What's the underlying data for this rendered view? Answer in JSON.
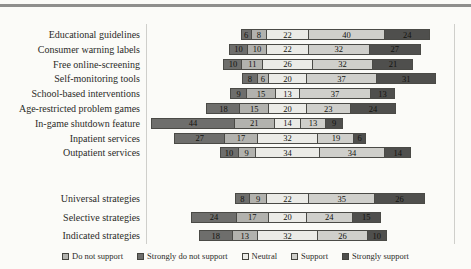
{
  "chart_data": {
    "type": "bar",
    "variant": "diverging_stacked_likert",
    "orientation": "horizontal",
    "unit": "percent",
    "title": "",
    "xlabel": "",
    "ylabel": "",
    "axes": "none",
    "value_labels": "inside",
    "legend_position": "bottom",
    "categories": [
      "Educational guidelines",
      "Consumer warning labels",
      "Free online-screening",
      "Self-monitoring tools",
      "School-based interventions",
      "Age-restricted problem games",
      "In-game shutdown feature",
      "Inpatient services",
      "Outpatient services",
      "Universal strategies",
      "Selective strategies",
      "Indicated strategies"
    ],
    "group_split_index": 9,
    "series": [
      {
        "name": "Strongly do not support",
        "color": "#6e6e6c",
        "values": [
          6,
          10,
          10,
          8,
          9,
          18,
          44,
          27,
          10,
          8,
          24,
          18
        ]
      },
      {
        "name": "Do not support",
        "color": "#b2b2ae",
        "values": [
          8,
          10,
          11,
          6,
          15,
          15,
          21,
          17,
          9,
          9,
          17,
          13
        ]
      },
      {
        "name": "Neutral",
        "color": "#ebebe7",
        "values": [
          22,
          22,
          26,
          20,
          13,
          20,
          14,
          32,
          34,
          22,
          20,
          32
        ]
      },
      {
        "name": "Support",
        "color": "#cfcfcb",
        "values": [
          40,
          32,
          32,
          37,
          37,
          23,
          13,
          19,
          34,
          35,
          24,
          26
        ]
      },
      {
        "name": "Strongly support",
        "color": "#4f4f4d",
        "values": [
          24,
          27,
          21,
          31,
          13,
          24,
          9,
          6,
          14,
          26,
          15,
          10
        ]
      }
    ],
    "legend": [
      {
        "label": "Do not support",
        "color": "#b2b2ae"
      },
      {
        "label": "Strongly do not support",
        "color": "#6e6e6c"
      },
      {
        "label": "Neutral",
        "color": "#ebebe7"
      },
      {
        "label": "Support",
        "color": "#cfcfcb"
      },
      {
        "label": "Strongly support",
        "color": "#4f4f4d"
      }
    ]
  }
}
